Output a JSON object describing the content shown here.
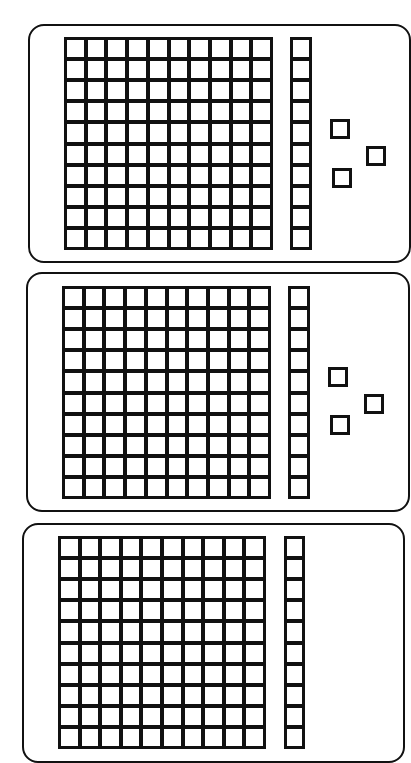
{
  "diagram": {
    "type": "base-ten-blocks",
    "colors": {
      "stroke": "#111111",
      "fill": "#ffffff"
    },
    "panels": [
      {
        "id": "panel-1",
        "box": {
          "x": 28,
          "y": 24,
          "w": 383,
          "h": 239
        },
        "hundreds": 1,
        "tens": 1,
        "ones": 3,
        "flat": {
          "x": 64,
          "y": 37,
          "w": 209,
          "h": 213,
          "rows": 10,
          "cols": 10
        },
        "rod": {
          "x": 290,
          "y": 37,
          "w": 22,
          "h": 213,
          "cells": 10
        },
        "units": [
          {
            "x": 330,
            "y": 119
          },
          {
            "x": 366,
            "y": 146
          },
          {
            "x": 332,
            "y": 168
          }
        ]
      },
      {
        "id": "panel-2",
        "box": {
          "x": 26,
          "y": 272,
          "w": 384,
          "h": 240
        },
        "hundreds": 1,
        "tens": 1,
        "ones": 3,
        "flat": {
          "x": 62,
          "y": 286,
          "w": 209,
          "h": 213,
          "rows": 10,
          "cols": 10
        },
        "rod": {
          "x": 288,
          "y": 286,
          "w": 22,
          "h": 213,
          "cells": 10
        },
        "units": [
          {
            "x": 328,
            "y": 367
          },
          {
            "x": 364,
            "y": 394
          },
          {
            "x": 330,
            "y": 415
          }
        ]
      },
      {
        "id": "panel-3",
        "box": {
          "x": 22,
          "y": 523,
          "w": 383,
          "h": 240
        },
        "hundreds": 1,
        "tens": 1,
        "ones": null,
        "flat": {
          "x": 58,
          "y": 536,
          "w": 208,
          "h": 213,
          "rows": 10,
          "cols": 10
        },
        "rod": {
          "x": 284,
          "y": 536,
          "w": 21,
          "h": 213,
          "cells": 10
        },
        "units": []
      }
    ],
    "labels": {
      "panel-1": "Base-ten blocks: one hundred flat, one ten rod, three unit cubes",
      "panel-2": "Base-ten blocks: one hundred flat, one ten rod, three unit cubes",
      "panel-3": "Base-ten blocks: one hundred flat, one ten rod (partially visible)"
    }
  }
}
